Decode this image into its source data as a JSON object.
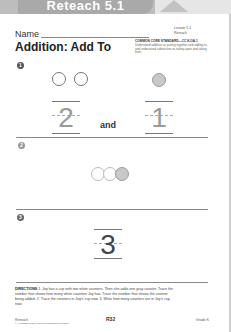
{
  "header": {
    "banner_title": "Reteach 5.1",
    "lesson": "Lesson 5.1",
    "lesson_type": "Reteach",
    "standard_label": "COMMON CORE STANDARD—CC.K.OA.1",
    "standard_text": "Understand addition as putting together and adding to, and understand subtraction as taking apart and taking from."
  },
  "worksheet": {
    "name_label": "Name",
    "title": "Addition: Add To"
  },
  "problems": [
    {
      "number": "1",
      "counters": [
        {
          "color": "white"
        },
        {
          "color": "white"
        },
        {
          "color": "gray"
        }
      ],
      "trace_left": "2",
      "connector": "and",
      "trace_right": "1"
    },
    {
      "number": "2",
      "counters": [
        {
          "color": "white"
        },
        {
          "color": "white"
        },
        {
          "color": "gray"
        }
      ]
    },
    {
      "number": "3",
      "answer": "3"
    }
  ],
  "directions": {
    "label": "DIRECTIONS",
    "text": "1. Joy has a cup with two white counters. Then she adds one gray counter. Trace the number that shows how many white counters Joy has. Trace the number that shows the counter being added. 2. Trace the counters in Joy's cup now. 3. Write how many counters are in Joy's cup now."
  },
  "footer": {
    "left": "Reteach",
    "copyright": "© Houghton Mifflin Harcourt Publishing Company",
    "page": "R32",
    "right": "Grade K"
  },
  "colors": {
    "banner": "#bdbdbd",
    "counter_gray": "#c8c8c8",
    "trace": "#9a9a9a"
  }
}
